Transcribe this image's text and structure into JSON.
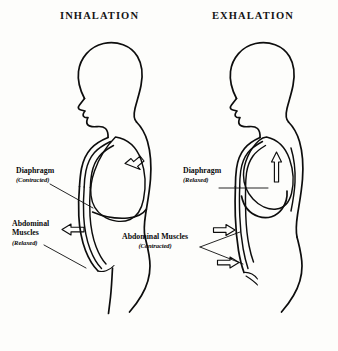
{
  "diagram": {
    "background_color": "#fdfdfb",
    "ink_color": "#0d0d0d"
  },
  "panels": [
    {
      "id": "inhalation",
      "title": "INHALATION",
      "labels": [
        {
          "id": "diaphragm-left",
          "name": "Diaphragm",
          "state": "(Contracted)"
        },
        {
          "id": "abdominal-left",
          "name_line1": "Abdominal",
          "name_line2": "Muscles",
          "state": "(Relaxed)"
        }
      ],
      "arrows": [
        {
          "id": "diaphragm-arrow",
          "direction": "down-left",
          "meaning": "diaphragm moves downward"
        },
        {
          "id": "abdominal-arrow",
          "direction": "left",
          "meaning": "abdominal wall moves outward"
        }
      ]
    },
    {
      "id": "exhalation",
      "title": "EXHALATION",
      "labels": [
        {
          "id": "diaphragm-right",
          "name": "Diaphragm",
          "state": "(Relaxed)"
        },
        {
          "id": "abdominal-right",
          "name_line1": "Abdominal Muscles",
          "state": "(Contracted)"
        }
      ],
      "arrows": [
        {
          "id": "diaphragm-arrow",
          "direction": "up",
          "meaning": "diaphragm moves upward"
        },
        {
          "id": "abdominal-arrow-upper",
          "direction": "right",
          "meaning": "abdominal wall moves inward"
        },
        {
          "id": "abdominal-arrow-lower",
          "direction": "right",
          "meaning": "abdominal wall moves inward"
        }
      ]
    }
  ]
}
